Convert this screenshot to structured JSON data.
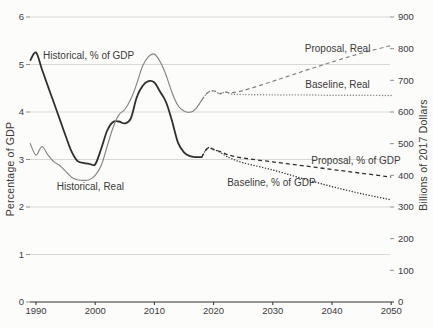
{
  "colors": {
    "background": "#fcfcfa",
    "dark_line": "#2f2f2f",
    "gray_line": "#838383",
    "grid": "#d8d8d5",
    "axis": "#2f2f2f",
    "tick": "#8f8f8f",
    "text": "#3a3a3a"
  },
  "chart_data": {
    "type": "line",
    "title": "",
    "left_axis": {
      "label": "Percentage of GDP",
      "range": [
        0,
        6
      ],
      "ticks": [
        "0",
        "1",
        "2",
        "3",
        "4",
        "5",
        "6"
      ]
    },
    "right_axis": {
      "label": "Billions of 2017 Dollars",
      "range": [
        0,
        900
      ],
      "ticks": [
        "0",
        "100",
        "200",
        "300",
        "400",
        "500",
        "600",
        "700",
        "800",
        "900"
      ]
    },
    "x_axis": {
      "range": [
        1990,
        2050
      ],
      "ticks": [
        "1990",
        "2000",
        "2010",
        "2020",
        "2030",
        "2040",
        "2050"
      ]
    },
    "grid": "horizontal gridlines at left-axis integers 1-6, bottom axis dark",
    "legend_position": "inline-annotations",
    "series": [
      {
        "name": "historical-pct-of-gdp",
        "label": "Historical, % of GDP",
        "axis": "left",
        "line_style": "solid",
        "color_role": "dark_line",
        "width": 1.8,
        "points": [
          [
            1989,
            5.08
          ],
          [
            1990,
            5.25
          ],
          [
            1991,
            4.9
          ],
          [
            1992,
            4.55
          ],
          [
            1993,
            4.2
          ],
          [
            1994,
            3.85
          ],
          [
            1995,
            3.5
          ],
          [
            1996,
            3.17
          ],
          [
            1997,
            2.97
          ],
          [
            1998,
            2.93
          ],
          [
            1999,
            2.91
          ],
          [
            2000,
            2.9
          ],
          [
            2001,
            3.22
          ],
          [
            2002,
            3.6
          ],
          [
            2003,
            3.79
          ],
          [
            2004,
            3.8
          ],
          [
            2005,
            3.76
          ],
          [
            2006,
            3.86
          ],
          [
            2007,
            4.3
          ],
          [
            2008,
            4.55
          ],
          [
            2009,
            4.65
          ],
          [
            2010,
            4.62
          ],
          [
            2011,
            4.42
          ],
          [
            2012,
            4.2
          ],
          [
            2013,
            3.8
          ],
          [
            2014,
            3.35
          ],
          [
            2015,
            3.15
          ],
          [
            2016,
            3.07
          ],
          [
            2017,
            3.05
          ],
          [
            2018,
            3.05
          ]
        ]
      },
      {
        "name": "historical-real",
        "label": "Historical, Real",
        "axis": "right",
        "line_style": "solid",
        "color_role": "gray_line",
        "width": 1.15,
        "points": [
          [
            1989,
            501
          ],
          [
            1990,
            464
          ],
          [
            1991,
            491
          ],
          [
            1992,
            465
          ],
          [
            1993,
            443
          ],
          [
            1994,
            431
          ],
          [
            1995,
            413
          ],
          [
            1996,
            394
          ],
          [
            1997,
            386
          ],
          [
            1998,
            384
          ],
          [
            1999,
            386
          ],
          [
            2000,
            400
          ],
          [
            2001,
            430
          ],
          [
            2002,
            490
          ],
          [
            2003,
            550
          ],
          [
            2004,
            591
          ],
          [
            2005,
            608
          ],
          [
            2006,
            640
          ],
          [
            2007,
            688
          ],
          [
            2008,
            745
          ],
          [
            2009,
            775
          ],
          [
            2010,
            783
          ],
          [
            2011,
            758
          ],
          [
            2012,
            715
          ],
          [
            2013,
            660
          ],
          [
            2014,
            620
          ],
          [
            2015,
            603
          ],
          [
            2016,
            599
          ],
          [
            2017,
            610
          ],
          [
            2018,
            638
          ]
        ]
      },
      {
        "name": "proposal-real",
        "label": "Proposal, Real",
        "axis": "right",
        "line_style": "dashed",
        "color_role": "gray_line",
        "width": 1.2,
        "points": [
          [
            2018,
            638
          ],
          [
            2019,
            661
          ],
          [
            2020,
            667
          ],
          [
            2021,
            658
          ],
          [
            2022,
            663
          ],
          [
            2023,
            661
          ],
          [
            2025,
            668
          ],
          [
            2030,
            697
          ],
          [
            2035,
            728
          ],
          [
            2040,
            758
          ],
          [
            2045,
            786
          ],
          [
            2050,
            810
          ]
        ]
      },
      {
        "name": "baseline-real",
        "label": "Baseline, Real",
        "axis": "right",
        "line_style": "dotted",
        "color_role": "gray_line",
        "width": 1.4,
        "points": [
          [
            2018,
            638
          ],
          [
            2019,
            661
          ],
          [
            2020,
            667
          ],
          [
            2021,
            658
          ],
          [
            2022,
            663
          ],
          [
            2023,
            657
          ],
          [
            2025,
            655
          ],
          [
            2030,
            654
          ],
          [
            2035,
            654
          ],
          [
            2040,
            653
          ],
          [
            2045,
            653
          ],
          [
            2050,
            652
          ]
        ]
      },
      {
        "name": "proposal-pct-of-gdp",
        "label": "Proposal, % of GDP",
        "axis": "left",
        "line_style": "dashed",
        "color_role": "dark_line",
        "width": 1.3,
        "points": [
          [
            2018,
            3.05
          ],
          [
            2019,
            3.24
          ],
          [
            2020,
            3.21
          ],
          [
            2021,
            3.17
          ],
          [
            2022,
            3.12
          ],
          [
            2023,
            3.08
          ],
          [
            2025,
            3.03
          ],
          [
            2030,
            2.95
          ],
          [
            2035,
            2.87
          ],
          [
            2040,
            2.79
          ],
          [
            2045,
            2.71
          ],
          [
            2050,
            2.63
          ]
        ]
      },
      {
        "name": "baseline-pct-of-gdp",
        "label": "Baseline, % of GDP",
        "axis": "left",
        "line_style": "dotted",
        "color_role": "dark_line",
        "width": 1.4,
        "points": [
          [
            2018,
            3.05
          ],
          [
            2019,
            3.24
          ],
          [
            2020,
            3.21
          ],
          [
            2021,
            3.16
          ],
          [
            2022,
            3.08
          ],
          [
            2023,
            3.02
          ],
          [
            2025,
            2.93
          ],
          [
            2030,
            2.78
          ],
          [
            2035,
            2.6
          ],
          [
            2040,
            2.43
          ],
          [
            2045,
            2.28
          ],
          [
            2050,
            2.15
          ]
        ]
      }
    ],
    "annotations": [
      {
        "name": "historical-pct-label",
        "text": "Historical, % of GDP",
        "year": 1991.2,
        "value": 5.19,
        "axis": "left"
      },
      {
        "name": "historical-real-label",
        "text": "Historical, Real",
        "year": 1993.5,
        "value": 363,
        "axis": "right"
      },
      {
        "name": "proposal-real-label",
        "text": "Proposal, Real",
        "year": 2035.4,
        "value": 800,
        "axis": "right"
      },
      {
        "name": "baseline-real-label",
        "text": "Baseline, Real",
        "year": 2035.5,
        "value": 688,
        "axis": "right"
      },
      {
        "name": "proposal-pct-label",
        "text": "Proposal, % of GDP",
        "year": 2036.5,
        "value": 2.98,
        "axis": "left"
      },
      {
        "name": "baseline-pct-label",
        "text": "Baseline, % of GDP",
        "year": 2022.3,
        "value": 2.51,
        "axis": "left"
      }
    ]
  }
}
